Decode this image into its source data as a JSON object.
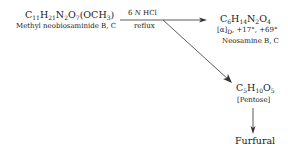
{
  "reactant": {
    "formula": {
      "parts": [
        "C",
        "11",
        "H",
        "21",
        "N",
        "2",
        "O",
        "7",
        "(OCH",
        "3",
        ")"
      ]
    },
    "name": "Methyl neobiosaminide B, C"
  },
  "reagent": {
    "conc_num": "6",
    "conc_unit": "N",
    "acid": "HCl",
    "condition": "reflux"
  },
  "product_1": {
    "formula": {
      "parts": [
        "C",
        "6",
        "H",
        "14",
        "N",
        "2",
        "O",
        "4"
      ]
    },
    "rotation": {
      "symbol": "[α]",
      "sub": "D",
      "values": ", +17°, +69°"
    },
    "name": "Neosamine B, C"
  },
  "product_2": {
    "formula": {
      "parts": [
        "C",
        "5",
        "H",
        "10",
        "O",
        "5"
      ]
    },
    "name": "[Pentose]"
  },
  "product_3": {
    "name": "Furfural"
  },
  "colors": {
    "ink": "#1a1a1a",
    "background": "#ffffff"
  }
}
